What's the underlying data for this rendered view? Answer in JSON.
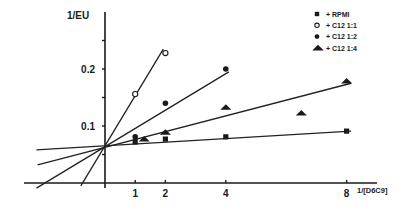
{
  "chart_data": {
    "type": "line",
    "title": "",
    "chart_kind": "Lineweaver-Burk double-reciprocal plot",
    "xlabel": "1/[D6C9]",
    "ylabel": "1/EU",
    "x_ticks": [
      1,
      2,
      4,
      8
    ],
    "x_tick_labels": [
      "1",
      "2",
      "4",
      "8"
    ],
    "y_ticks": [
      0.05,
      0.1,
      0.15,
      0.2,
      0.25
    ],
    "y_tick_labels": [
      "0.1",
      "0.2"
    ],
    "y_tick_label_values": [
      0.1,
      0.2
    ],
    "xlim": [
      -2.7,
      9.1
    ],
    "ylim": [
      0,
      0.25
    ],
    "grid": false,
    "legend_position": "top-right",
    "common_intercept": {
      "x": 0,
      "y": 0.064
    },
    "series": [
      {
        "name": "+ RPMI",
        "marker": "square-filled",
        "points": [
          {
            "x": 1,
            "y": 0.072
          },
          {
            "x": 2,
            "y": 0.077
          },
          {
            "x": 4,
            "y": 0.081
          },
          {
            "x": 8,
            "y": 0.091
          }
        ],
        "fit_line": {
          "x0": -2.27,
          "y0": 0.058,
          "x1": 8.15,
          "y1": 0.091
        }
      },
      {
        "name": "+ C12 1:1",
        "marker": "circle-open",
        "points": [
          {
            "x": 1,
            "y": 0.156
          },
          {
            "x": 2,
            "y": 0.228
          }
        ],
        "fit_line": {
          "x0": -0.8,
          "y0": -0.005,
          "x1": 1.93,
          "y1": 0.235
        }
      },
      {
        "name": "+ C12 1:2",
        "marker": "circle-filled",
        "points": [
          {
            "x": 1,
            "y": 0.081
          },
          {
            "x": 2,
            "y": 0.14
          },
          {
            "x": 4,
            "y": 0.2
          }
        ],
        "fit_line": {
          "x0": -2.27,
          "y0": -0.009,
          "x1": 4.1,
          "y1": 0.195
        }
      },
      {
        "name": "+ C12 1:4",
        "marker": "triangle-filled",
        "points": [
          {
            "x": 1.3,
            "y": 0.077
          },
          {
            "x": 2,
            "y": 0.089
          },
          {
            "x": 4,
            "y": 0.133
          },
          {
            "x": 6.5,
            "y": 0.123
          },
          {
            "x": 8,
            "y": 0.179
          }
        ],
        "fit_line": {
          "x0": -2.23,
          "y0": 0.032,
          "x1": 8.15,
          "y1": 0.175
        }
      }
    ]
  },
  "layout": {
    "origin_px": {
      "x": 105,
      "y": 183
    },
    "px_per_x_unit": 30.2,
    "px_per_y_unit": 570,
    "x_axis_px": {
      "x0": 24,
      "x1": 377
    },
    "y_axis_px": {
      "y0": 12,
      "y1": 188
    },
    "legend_px": {
      "x": 317,
      "y": 14,
      "row_h": 11.3
    }
  }
}
